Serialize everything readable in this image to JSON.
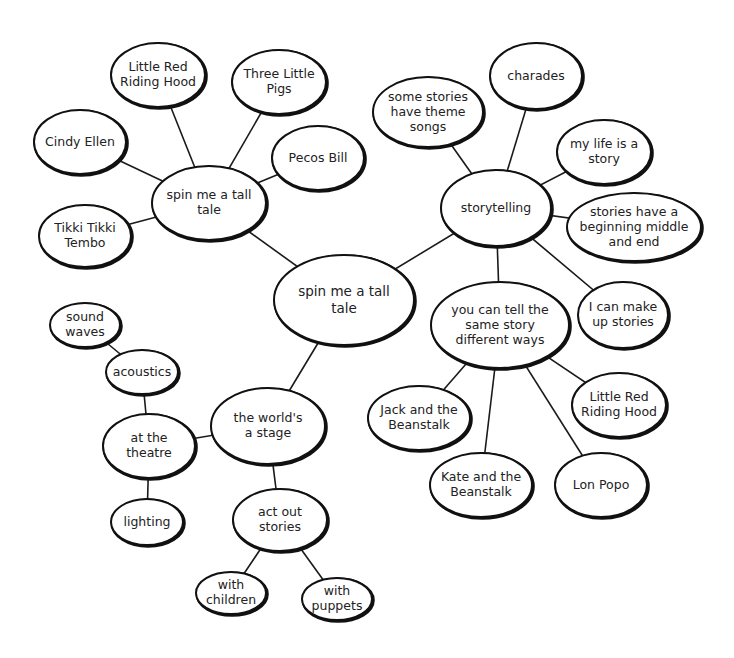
{
  "diagram": {
    "type": "mind-map",
    "background": "#ffffff",
    "line_color": "#1a1a1a",
    "nodes": [
      {
        "id": "root",
        "lines": [
          "spin me a tall",
          "tale"
        ],
        "cx": 344,
        "cy": 300,
        "rx": 70,
        "ry": 45,
        "big": true
      },
      {
        "id": "tall-tale",
        "lines": [
          "spin me a tall",
          "tale"
        ],
        "cx": 209,
        "cy": 203,
        "rx": 57,
        "ry": 37
      },
      {
        "id": "lrrh-1",
        "lines": [
          "Little Red",
          "Riding Hood"
        ],
        "cx": 158,
        "cy": 75,
        "rx": 47,
        "ry": 32
      },
      {
        "id": "three-pigs",
        "lines": [
          "Three Little",
          "Pigs"
        ],
        "cx": 279,
        "cy": 82,
        "rx": 47,
        "ry": 32
      },
      {
        "id": "cindy-ellen",
        "lines": [
          "Cindy Ellen"
        ],
        "cx": 80,
        "cy": 142,
        "rx": 46,
        "ry": 32
      },
      {
        "id": "pecos-bill",
        "lines": [
          "Pecos Bill"
        ],
        "cx": 318,
        "cy": 158,
        "rx": 46,
        "ry": 32
      },
      {
        "id": "tikki",
        "lines": [
          "Tikki Tikki",
          "Tembo"
        ],
        "cx": 85,
        "cy": 236,
        "rx": 46,
        "ry": 31
      },
      {
        "id": "storytelling",
        "lines": [
          "storytelling"
        ],
        "cx": 496,
        "cy": 208,
        "rx": 55,
        "ry": 38
      },
      {
        "id": "theme-songs",
        "lines": [
          "some stories",
          "have theme",
          "songs"
        ],
        "cx": 428,
        "cy": 112,
        "rx": 55,
        "ry": 35
      },
      {
        "id": "charades",
        "lines": [
          "charades"
        ],
        "cx": 536,
        "cy": 76,
        "rx": 46,
        "ry": 33
      },
      {
        "id": "my-life",
        "lines": [
          "my life is a",
          "story"
        ],
        "cx": 604,
        "cy": 152,
        "rx": 47,
        "ry": 32
      },
      {
        "id": "beginning",
        "lines": [
          "stories have a",
          "beginning middle",
          "and end"
        ],
        "cx": 634,
        "cy": 227,
        "rx": 67,
        "ry": 34
      },
      {
        "id": "make-up",
        "lines": [
          "I can make",
          "up stories"
        ],
        "cx": 623,
        "cy": 315,
        "rx": 45,
        "ry": 33
      },
      {
        "id": "diff-ways",
        "lines": [
          "you can tell the",
          "same story",
          "different ways"
        ],
        "cx": 500,
        "cy": 325,
        "rx": 69,
        "ry": 43
      },
      {
        "id": "jack",
        "lines": [
          "Jack and the",
          "Beanstalk"
        ],
        "cx": 419,
        "cy": 418,
        "rx": 51,
        "ry": 32
      },
      {
        "id": "kate",
        "lines": [
          "Kate and the",
          "Beanstalk"
        ],
        "cx": 481,
        "cy": 485,
        "rx": 51,
        "ry": 32
      },
      {
        "id": "lon-popo",
        "lines": [
          "Lon Popo"
        ],
        "cx": 601,
        "cy": 485,
        "rx": 46,
        "ry": 32
      },
      {
        "id": "lrrh-2",
        "lines": [
          "Little Red",
          "Riding Hood"
        ],
        "cx": 619,
        "cy": 405,
        "rx": 47,
        "ry": 32
      },
      {
        "id": "worlds-stage",
        "lines": [
          "the world's",
          "a stage"
        ],
        "cx": 268,
        "cy": 426,
        "rx": 57,
        "ry": 38
      },
      {
        "id": "theatre",
        "lines": [
          "at the",
          "theatre"
        ],
        "cx": 149,
        "cy": 446,
        "rx": 46,
        "ry": 32
      },
      {
        "id": "acoustics",
        "lines": [
          "acoustics"
        ],
        "cx": 142,
        "cy": 372,
        "rx": 36,
        "ry": 22
      },
      {
        "id": "sound-waves",
        "lines": [
          "sound",
          "waves"
        ],
        "cx": 85,
        "cy": 325,
        "rx": 35,
        "ry": 22
      },
      {
        "id": "lighting",
        "lines": [
          "lighting"
        ],
        "cx": 147,
        "cy": 522,
        "rx": 36,
        "ry": 23
      },
      {
        "id": "act-out",
        "lines": [
          "act out",
          "stories"
        ],
        "cx": 280,
        "cy": 520,
        "rx": 47,
        "ry": 31
      },
      {
        "id": "children",
        "lines": [
          "with",
          "children"
        ],
        "cx": 231,
        "cy": 593,
        "rx": 35,
        "ry": 21
      },
      {
        "id": "puppets",
        "lines": [
          "with",
          "puppets"
        ],
        "cx": 337,
        "cy": 599,
        "rx": 35,
        "ry": 21
      }
    ],
    "edges": [
      [
        "root",
        "tall-tale"
      ],
      [
        "root",
        "storytelling"
      ],
      [
        "root",
        "worlds-stage"
      ],
      [
        "tall-tale",
        "lrrh-1"
      ],
      [
        "tall-tale",
        "three-pigs"
      ],
      [
        "tall-tale",
        "cindy-ellen"
      ],
      [
        "tall-tale",
        "pecos-bill"
      ],
      [
        "tall-tale",
        "tikki"
      ],
      [
        "storytelling",
        "theme-songs"
      ],
      [
        "storytelling",
        "charades"
      ],
      [
        "storytelling",
        "my-life"
      ],
      [
        "storytelling",
        "beginning"
      ],
      [
        "storytelling",
        "make-up"
      ],
      [
        "storytelling",
        "diff-ways"
      ],
      [
        "diff-ways",
        "jack"
      ],
      [
        "diff-ways",
        "kate"
      ],
      [
        "diff-ways",
        "lon-popo"
      ],
      [
        "diff-ways",
        "lrrh-2"
      ],
      [
        "worlds-stage",
        "theatre"
      ],
      [
        "worlds-stage",
        "act-out"
      ],
      [
        "theatre",
        "acoustics"
      ],
      [
        "acoustics",
        "sound-waves"
      ],
      [
        "theatre",
        "lighting"
      ],
      [
        "act-out",
        "children"
      ],
      [
        "act-out",
        "puppets"
      ]
    ]
  }
}
